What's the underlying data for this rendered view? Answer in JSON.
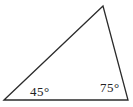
{
  "diagram": {
    "type": "geometry-triangle",
    "background_color": "#ffffff",
    "triangle": {
      "points_attr": "4,100 103,6 128,100",
      "vertices": [
        {
          "name": "bottom-left",
          "x": 4,
          "y": 100
        },
        {
          "name": "top",
          "x": 103,
          "y": 6
        },
        {
          "name": "bottom-right",
          "x": 128,
          "y": 100
        }
      ],
      "stroke_color": "#2b2b2b"
    },
    "angle_labels": [
      {
        "text": "45°",
        "vertex": "bottom-left"
      },
      {
        "text": "75°",
        "vertex": "bottom-right"
      }
    ]
  }
}
